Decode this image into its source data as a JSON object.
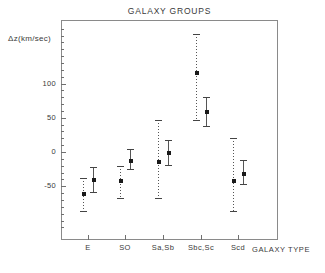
{
  "chart_data": {
    "type": "scatter",
    "title": "GALAXY GROUPS",
    "xlabel": "GALAXY TYPE",
    "ylabel": "Δz(km/sec)",
    "categories": [
      "E",
      "SO",
      "Sa,Sb",
      "Sbc,Sc",
      "Scd"
    ],
    "ylim": [
      -110,
      180
    ],
    "yticks": [
      -50,
      0,
      50,
      100
    ],
    "ytick_labels": [
      "-50",
      "0",
      "50",
      "100"
    ],
    "grid": false,
    "legend": false,
    "series": [
      {
        "name": "first sample",
        "style": "dashed",
        "values": [
          -62,
          -43,
          -15,
          115,
          -43
        ],
        "err_low": [
          -88,
          -68,
          -68,
          45,
          -88
        ],
        "err_high": [
          -38,
          -20,
          46,
          172,
          20
        ]
      },
      {
        "name": "second sample",
        "style": "solid",
        "values": [
          -41,
          -13,
          -2,
          59,
          -32
        ],
        "err_low": [
          -60,
          -27,
          -20,
          37,
          -48
        ],
        "err_high": [
          -22,
          5,
          18,
          80,
          -12
        ]
      }
    ],
    "points": [
      {
        "category": "E",
        "series": "first sample",
        "value": -62,
        "low": -88,
        "high": -38
      },
      {
        "category": "E",
        "series": "second sample",
        "value": -41,
        "low": -60,
        "high": -22
      },
      {
        "category": "SO",
        "series": "first sample",
        "value": -43,
        "low": -68,
        "high": -20
      },
      {
        "category": "SO",
        "series": "second sample",
        "value": -13,
        "low": -27,
        "high": 5
      },
      {
        "category": "Sa,Sb",
        "series": "first sample",
        "value": -15,
        "low": -68,
        "high": 46
      },
      {
        "category": "Sa,Sb",
        "series": "second sample",
        "value": -2,
        "low": -20,
        "high": 18
      },
      {
        "category": "Sbc,Sc",
        "series": "first sample",
        "value": 115,
        "low": 45,
        "high": 172
      },
      {
        "category": "Sbc,Sc",
        "series": "second sample",
        "value": 59,
        "low": 37,
        "high": 80
      },
      {
        "category": "Scd",
        "series": "first sample",
        "value": -43,
        "low": -88,
        "high": 20
      },
      {
        "category": "Scd",
        "series": "second sample",
        "value": -32,
        "low": -48,
        "high": -12
      }
    ]
  },
  "axis": {
    "y_label": "Δz(km/sec)",
    "x_label": "GALAXY TYPE",
    "y_tick_labels": [
      "100",
      "50",
      "0",
      "-50"
    ],
    "x_tick_labels": [
      "E",
      "SO",
      "Sa,Sb",
      "Sbc,Sc",
      "Scd"
    ]
  },
  "title": "GALAXY GROUPS",
  "colors": {
    "frame": "#8a8a8a",
    "text": "#3a3a3a",
    "marker": "#1a1a1a",
    "errorbar": "#555555",
    "background": "#ffffff"
  }
}
